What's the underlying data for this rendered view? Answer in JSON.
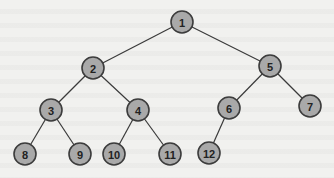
{
  "diagram": {
    "type": "binary-tree",
    "colors": {
      "background": "#f1f1ef",
      "node_fill": "#a9a9a9",
      "node_stroke": "#3c3c3c",
      "edge": "#3a3a3a",
      "label": "#222222"
    },
    "nodes": [
      {
        "id": "1",
        "label": "1",
        "x": 182,
        "y": 22
      },
      {
        "id": "2",
        "label": "2",
        "x": 93,
        "y": 68
      },
      {
        "id": "5",
        "label": "5",
        "x": 270,
        "y": 66
      },
      {
        "id": "3",
        "label": "3",
        "x": 51,
        "y": 110
      },
      {
        "id": "4",
        "label": "4",
        "x": 138,
        "y": 110
      },
      {
        "id": "6",
        "label": "6",
        "x": 229,
        "y": 108
      },
      {
        "id": "7",
        "label": "7",
        "x": 310,
        "y": 106
      },
      {
        "id": "8",
        "label": "8",
        "x": 25,
        "y": 154
      },
      {
        "id": "9",
        "label": "9",
        "x": 80,
        "y": 154
      },
      {
        "id": "10",
        "label": "10",
        "x": 114,
        "y": 154
      },
      {
        "id": "11",
        "label": "11",
        "x": 170,
        "y": 154
      },
      {
        "id": "12",
        "label": "12",
        "x": 209,
        "y": 153
      }
    ],
    "edges": [
      [
        "1",
        "2"
      ],
      [
        "1",
        "5"
      ],
      [
        "2",
        "3"
      ],
      [
        "2",
        "4"
      ],
      [
        "5",
        "6"
      ],
      [
        "5",
        "7"
      ],
      [
        "3",
        "8"
      ],
      [
        "3",
        "9"
      ],
      [
        "4",
        "10"
      ],
      [
        "4",
        "11"
      ],
      [
        "6",
        "12"
      ]
    ],
    "node_radius": 11
  }
}
